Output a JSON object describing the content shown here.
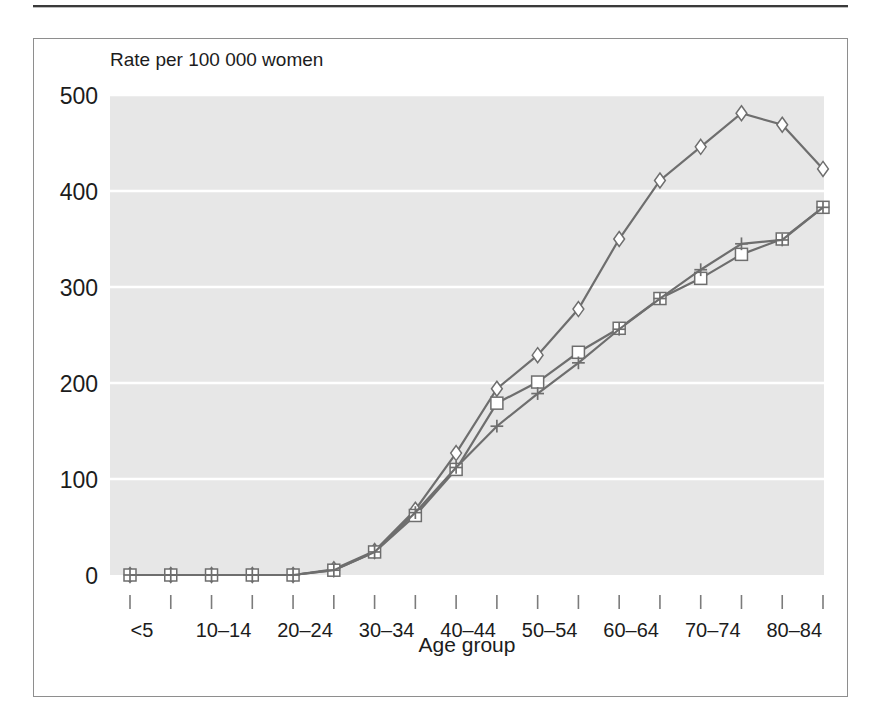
{
  "figure": {
    "y_axis_caption": "Rate per 100 000 women",
    "x_axis_title": "Age group",
    "plot_background": "#e7e7e7",
    "gridline_color": "#ffffff",
    "frame_color": "#8e8e8e",
    "series_color": "#6e6e6e",
    "marker_fill": "#ffffff",
    "text_color": "#1c1c1c"
  },
  "chart_data": {
    "type": "line",
    "title": "",
    "subtitle": "",
    "xlabel": "Age group",
    "ylabel": "Rate per 100 000 women",
    "ylim": [
      0,
      500
    ],
    "yticks": [
      0,
      100,
      200,
      300,
      400,
      500
    ],
    "ytick_labels": [
      "0",
      "100",
      "200",
      "300",
      "400",
      "500"
    ],
    "grid": "horizontal",
    "legend_position": "none",
    "categories": [
      "<5",
      "5–9",
      "10–14",
      "15–19",
      "20–24",
      "25–29",
      "30–34",
      "35–39",
      "40–44",
      "45–49",
      "50–54",
      "55–59",
      "60–64",
      "65–69",
      "70–74",
      "75–79",
      "80–84",
      "85+"
    ],
    "xtick_labels_shown": [
      "<5",
      "",
      "10–14",
      "",
      "20–24",
      "",
      "30–34",
      "",
      "40–44",
      "",
      "50–54",
      "",
      "60–64",
      "",
      "70–74",
      "",
      "80–84",
      ""
    ],
    "series": [
      {
        "name": "series-diamond",
        "marker": "diamond",
        "values": [
          0,
          0,
          0,
          0,
          0,
          6,
          25,
          68,
          127,
          194,
          229,
          277,
          350,
          411,
          446,
          481,
          469,
          423
        ]
      },
      {
        "name": "series-square",
        "marker": "square",
        "values": [
          0,
          0,
          0,
          0,
          0,
          5,
          24,
          62,
          110,
          179,
          201,
          232,
          257,
          288,
          309,
          334,
          350,
          383
        ]
      },
      {
        "name": "series-plus",
        "marker": "plus",
        "values": [
          0,
          0,
          0,
          0,
          0,
          5,
          24,
          65,
          112,
          155,
          189,
          221,
          256,
          288,
          318,
          345,
          349,
          383
        ]
      }
    ]
  }
}
